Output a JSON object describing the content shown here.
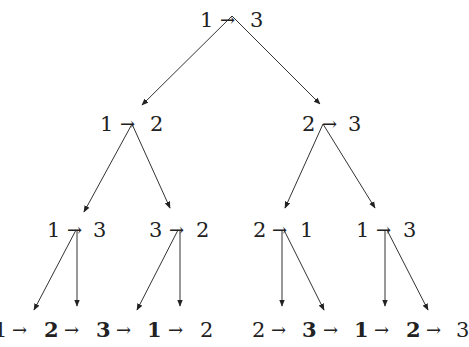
{
  "diagram": {
    "type": "recursion-tree",
    "arrow_glyph": "→",
    "root": {
      "from": "1",
      "to": "3"
    },
    "level1": [
      {
        "from": "1",
        "to": "2"
      },
      {
        "from": "2",
        "to": "3"
      }
    ],
    "level2": [
      {
        "from": "1",
        "to": "3"
      },
      {
        "from": "3",
        "to": "2"
      },
      {
        "from": "2",
        "to": "1"
      },
      {
        "from": "1",
        "to": "3"
      }
    ],
    "sequences": [
      {
        "items": [
          "1",
          "2",
          "3",
          "1",
          "2"
        ],
        "bold": [
          false,
          true,
          true,
          true,
          false
        ]
      },
      {
        "items": [
          "2",
          "3",
          "1",
          "2",
          "3"
        ],
        "bold": [
          false,
          true,
          true,
          true,
          false
        ]
      }
    ],
    "line_color": "#333333",
    "text_color": "#222222"
  }
}
